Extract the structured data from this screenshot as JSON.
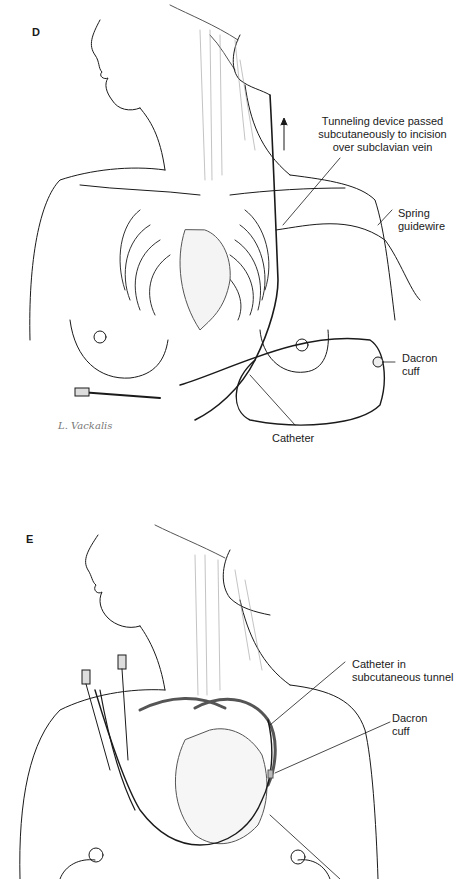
{
  "panel_d": {
    "letter": "D",
    "labels": {
      "tunneling": "Tunneling device passed\nsubcutaneously to incision\nover subclavian vein",
      "guidewire": "Spring\nguidewire",
      "cuff": "Dacron\ncuff",
      "catheter": "Catheter"
    },
    "signature": "L. Vackalis"
  },
  "panel_e": {
    "letter": "E",
    "labels": {
      "tunnel": "Catheter in\nsubcutaneous tunnel",
      "cuff": "Dacron\ncuff"
    }
  },
  "colors": {
    "ink": "#1a1a1a",
    "shade": "#9a9a9a",
    "background": "#ffffff"
  }
}
